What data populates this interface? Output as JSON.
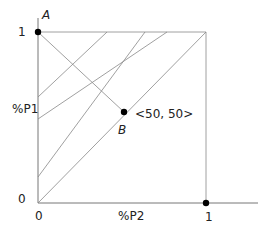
{
  "diagram": {
    "type": "probability-simplex",
    "axes": {
      "y_label": "%P1",
      "x_label": "%P2",
      "y_ticks": [
        "1",
        "0"
      ],
      "x_ticks": [
        "0",
        "1"
      ]
    },
    "points": [
      {
        "id": "A",
        "label": "A",
        "coords_label": ""
      },
      {
        "id": "B",
        "label": "B",
        "coords_label": "<50, 50>"
      },
      {
        "id": "C",
        "label": "",
        "coords_label": ""
      }
    ],
    "colors": {
      "line": "#888888",
      "axis": "#777777",
      "point": "#000000",
      "text": "#222222"
    }
  }
}
